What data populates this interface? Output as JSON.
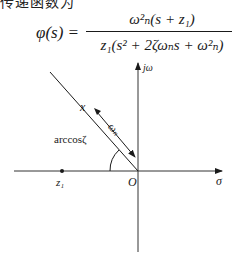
{
  "header": {
    "partial_text": "传递函数为"
  },
  "formula": {
    "lhs": "φ(s) =",
    "numerator": "ω²ₙ(s + z₁)",
    "denominator": "z₁(s² + 2ζωₙs + ω²ₙ)"
  },
  "diagram": {
    "axis_imag_label": "jω",
    "axis_real_label": "σ",
    "origin_label": "O",
    "zero_label": "z₁",
    "pole_marker_label": "x",
    "magnitude_label": "ωₙ",
    "angle_label": "arccosζ"
  }
}
